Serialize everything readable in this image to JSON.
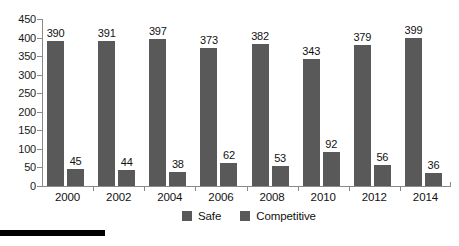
{
  "chart_data": {
    "type": "bar",
    "title": "",
    "xlabel": "",
    "ylabel": "",
    "ylim": [
      0,
      450
    ],
    "ytick_step": 50,
    "yticks": [
      "450",
      "400",
      "350",
      "300",
      "250",
      "200",
      "150",
      "100",
      "50",
      "0"
    ],
    "grid": false,
    "legend_position": "bottom",
    "categories": [
      "2000",
      "2002",
      "2004",
      "2006",
      "2008",
      "2010",
      "2012",
      "2014"
    ],
    "series": [
      {
        "name": "Safe",
        "color": "#595959",
        "values": [
          390,
          391,
          397,
          373,
          382,
          343,
          379,
          399
        ],
        "labels": [
          "390",
          "391",
          "397",
          "373",
          "382",
          "343",
          "379",
          "399"
        ]
      },
      {
        "name": "Competitive",
        "color": "#595959",
        "values": [
          45,
          44,
          38,
          62,
          53,
          92,
          56,
          36
        ],
        "labels": [
          "45",
          "44",
          "38",
          "62",
          "53",
          "92",
          "56",
          "36"
        ]
      }
    ]
  },
  "legend": {
    "items": [
      {
        "label": "Safe",
        "swatch_color": "#595959"
      },
      {
        "label": "Competitive",
        "swatch_color": "#595959"
      }
    ]
  },
  "colors": {
    "bar": "#595959",
    "axis": "#8a8a8a",
    "text": "#111111",
    "background": "#ffffff",
    "rule": "#000000"
  }
}
